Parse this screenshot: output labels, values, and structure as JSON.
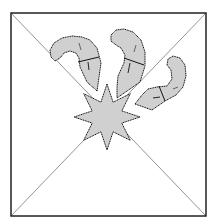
{
  "figure": {
    "colors": {
      "background": "#ffffff",
      "frame": "#222222",
      "diagonal": "#888888",
      "fill": "#d0d0d0",
      "outline": "#111111"
    },
    "frame": {
      "x1": 11,
      "y1": 13,
      "x2": 206,
      "y2": 216
    },
    "star": {
      "cx": 107,
      "cy": 117,
      "points": 8,
      "outer_r": 33,
      "inner_r": 16
    },
    "tentacles": [
      {
        "name": "left"
      },
      {
        "name": "middle"
      },
      {
        "name": "right"
      }
    ]
  }
}
